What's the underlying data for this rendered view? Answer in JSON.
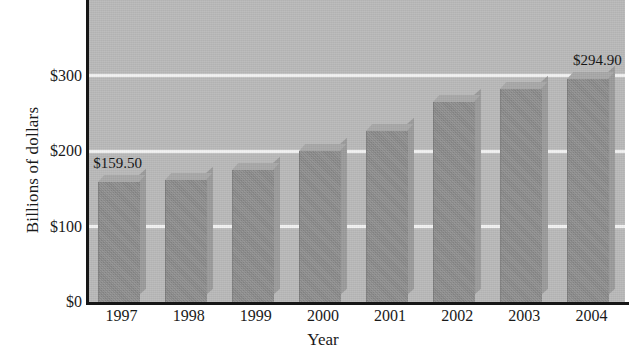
{
  "chart_data": {
    "type": "bar",
    "title": "",
    "subtitle": "",
    "xlabel": "Year",
    "ylabel": "Billions of dollars",
    "categories": [
      "1997",
      "1998",
      "1999",
      "2000",
      "2001",
      "2002",
      "2003",
      "2004"
    ],
    "values": [
      159.5,
      162.0,
      175.0,
      200.0,
      227.0,
      265.0,
      282.0,
      294.9
    ],
    "point_labels": [
      "$159.50",
      "",
      "",
      "",
      "",
      "",
      "",
      "$294.90"
    ],
    "ytick_labels": [
      "$0",
      "$100",
      "$200",
      "$300"
    ],
    "ytick_values": [
      0,
      100,
      200,
      300
    ],
    "ylim": [
      0,
      400
    ],
    "xlim_categories": 8,
    "grid": true,
    "grid_axis": "y",
    "legend": false,
    "legend_position": "none",
    "series": [
      {
        "name": "Billions of dollars",
        "values": [
          159.5,
          162.0,
          175.0,
          200.0,
          227.0,
          265.0,
          282.0,
          294.9
        ]
      }
    ],
    "colors": {
      "bar_front": "#8e8e8e",
      "bar_top": "#a8a8a8",
      "bar_side": "#9b9b9b",
      "plot_background": "#b9b9b9",
      "gridline": "#f2f2f2",
      "axis": "#161616",
      "text": "#1a1a1a"
    },
    "style": "3d-bars-grayscale-scan"
  }
}
